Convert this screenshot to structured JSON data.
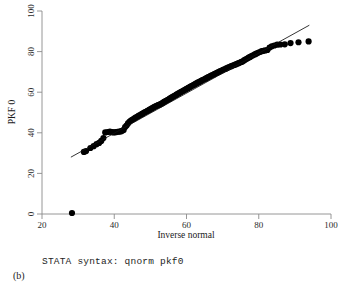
{
  "figure": {
    "panel_label": "(b)",
    "syntax_caption": "STATA syntax: qnorm pkf0"
  },
  "chart_data": {
    "type": "scatter",
    "title": "",
    "xlabel": "Inverse normal",
    "ylabel": "PKF 0",
    "xlim": [
      20,
      100
    ],
    "ylim": [
      0,
      100
    ],
    "xticks": [
      20,
      40,
      60,
      80,
      100
    ],
    "yticks": [
      0,
      20,
      40,
      60,
      80,
      100
    ],
    "xtick_labels": [
      "20",
      "40",
      "60",
      "80",
      "100"
    ],
    "ytick_labels": [
      "0",
      "20",
      "40",
      "60",
      "80",
      "100"
    ],
    "grid": false,
    "legend": "none",
    "marker_color": "#000000",
    "marker_size": 3.1,
    "reference_line": {
      "label": "reference line",
      "color": "#111111",
      "x": [
        28.0,
        94.0
      ],
      "y": [
        28.0,
        93.0
      ]
    },
    "series": [
      {
        "name": "PKF 0 quantiles",
        "points": [
          [
            28.3,
            0.5
          ],
          [
            31.6,
            30.6
          ],
          [
            32.2,
            31.0
          ],
          [
            33.4,
            32.5
          ],
          [
            34.3,
            33.4
          ],
          [
            35.1,
            34.4
          ],
          [
            35.8,
            35.0
          ],
          [
            36.4,
            36.0
          ],
          [
            37.0,
            37.4
          ],
          [
            37.5,
            40.2
          ],
          [
            38.2,
            40.4
          ],
          [
            38.8,
            40.6
          ],
          [
            39.4,
            40.3
          ],
          [
            39.9,
            40.2
          ],
          [
            40.4,
            40.3
          ],
          [
            40.9,
            40.5
          ],
          [
            41.4,
            40.6
          ],
          [
            41.8,
            40.7
          ],
          [
            42.2,
            41.0
          ],
          [
            42.6,
            41.4
          ],
          [
            43.0,
            42.8
          ],
          [
            43.4,
            43.6
          ],
          [
            43.8,
            44.6
          ],
          [
            44.2,
            45.4
          ],
          [
            44.6,
            46.0
          ],
          [
            45.0,
            46.4
          ],
          [
            45.3,
            46.8
          ],
          [
            45.7,
            47.2
          ],
          [
            46.0,
            47.6
          ],
          [
            46.4,
            47.9
          ],
          [
            46.7,
            48.3
          ],
          [
            47.0,
            48.6
          ],
          [
            47.4,
            49.0
          ],
          [
            47.7,
            49.3
          ],
          [
            48.0,
            49.6
          ],
          [
            48.3,
            50.0
          ],
          [
            48.6,
            50.2
          ],
          [
            48.9,
            50.5
          ],
          [
            49.2,
            50.8
          ],
          [
            49.5,
            51.1
          ],
          [
            49.8,
            51.4
          ],
          [
            50.1,
            51.7
          ],
          [
            50.4,
            52.0
          ],
          [
            50.7,
            52.3
          ],
          [
            51.0,
            52.6
          ],
          [
            51.3,
            52.9
          ],
          [
            51.6,
            53.2
          ],
          [
            51.9,
            53.4
          ],
          [
            52.2,
            53.6
          ],
          [
            52.4,
            53.8
          ],
          [
            52.7,
            54.0
          ],
          [
            53.0,
            54.3
          ],
          [
            53.3,
            54.6
          ],
          [
            53.6,
            54.9
          ],
          [
            53.8,
            55.2
          ],
          [
            54.1,
            55.5
          ],
          [
            54.4,
            55.8
          ],
          [
            54.7,
            56.1
          ],
          [
            55.0,
            56.4
          ],
          [
            55.3,
            56.7
          ],
          [
            55.5,
            57.0
          ],
          [
            55.8,
            57.3
          ],
          [
            56.1,
            57.6
          ],
          [
            56.4,
            57.9
          ],
          [
            56.7,
            58.2
          ],
          [
            57.0,
            58.5
          ],
          [
            57.2,
            58.8
          ],
          [
            57.5,
            59.1
          ],
          [
            57.8,
            59.4
          ],
          [
            58.1,
            59.7
          ],
          [
            58.4,
            60.0
          ],
          [
            58.7,
            60.3
          ],
          [
            59.0,
            60.6
          ],
          [
            59.3,
            60.9
          ],
          [
            59.6,
            61.2
          ],
          [
            59.9,
            61.5
          ],
          [
            60.2,
            61.8
          ],
          [
            60.5,
            62.1
          ],
          [
            60.8,
            62.4
          ],
          [
            61.1,
            62.7
          ],
          [
            61.4,
            63.0
          ],
          [
            61.7,
            63.3
          ],
          [
            62.0,
            63.6
          ],
          [
            62.3,
            63.9
          ],
          [
            62.6,
            64.2
          ],
          [
            62.9,
            64.5
          ],
          [
            63.2,
            64.8
          ],
          [
            63.5,
            65.0
          ],
          [
            63.8,
            65.3
          ],
          [
            64.1,
            65.6
          ],
          [
            64.4,
            65.9
          ],
          [
            64.8,
            66.2
          ],
          [
            65.1,
            66.5
          ],
          [
            65.4,
            66.8
          ],
          [
            65.7,
            67.1
          ],
          [
            66.0,
            67.4
          ],
          [
            66.4,
            67.7
          ],
          [
            66.7,
            68.0
          ],
          [
            67.0,
            68.3
          ],
          [
            67.4,
            68.6
          ],
          [
            67.7,
            68.9
          ],
          [
            68.0,
            69.2
          ],
          [
            68.4,
            69.5
          ],
          [
            68.7,
            69.8
          ],
          [
            69.1,
            70.1
          ],
          [
            69.4,
            70.4
          ],
          [
            69.8,
            70.7
          ],
          [
            70.1,
            71.0
          ],
          [
            70.5,
            71.3
          ],
          [
            70.9,
            71.6
          ],
          [
            71.2,
            71.9
          ],
          [
            71.6,
            72.2
          ],
          [
            72.0,
            72.5
          ],
          [
            72.4,
            72.8
          ],
          [
            72.8,
            73.1
          ],
          [
            73.2,
            73.4
          ],
          [
            73.6,
            73.7
          ],
          [
            74.0,
            74.0
          ],
          [
            74.4,
            74.3
          ],
          [
            74.8,
            74.6
          ],
          [
            75.2,
            74.9
          ],
          [
            75.6,
            75.2
          ],
          [
            76.0,
            75.8
          ],
          [
            76.4,
            76.2
          ],
          [
            76.8,
            76.6
          ],
          [
            77.2,
            77.0
          ],
          [
            77.6,
            77.4
          ],
          [
            78.0,
            77.8
          ],
          [
            78.4,
            78.2
          ],
          [
            78.9,
            78.6
          ],
          [
            79.3,
            79.0
          ],
          [
            79.8,
            79.4
          ],
          [
            80.3,
            79.8
          ],
          [
            80.8,
            80.2
          ],
          [
            81.3,
            80.4
          ],
          [
            81.8,
            80.6
          ],
          [
            82.4,
            80.8
          ],
          [
            83.0,
            82.0
          ],
          [
            83.6,
            82.6
          ],
          [
            84.3,
            83.0
          ],
          [
            85.1,
            83.4
          ],
          [
            86.0,
            83.5
          ],
          [
            87.2,
            83.6
          ],
          [
            88.8,
            84.2
          ],
          [
            91.0,
            84.6
          ],
          [
            93.8,
            85.0
          ]
        ]
      }
    ]
  }
}
